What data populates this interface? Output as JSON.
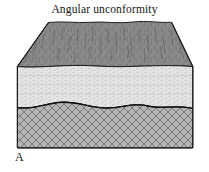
{
  "figure": {
    "title": "Angular unconformity",
    "panel_label": "A",
    "type": "geologic-block-diagram",
    "subject": "angular unconformity"
  },
  "diagram": {
    "view": "three-dimensional block diagram with top surface in oblique perspective",
    "outline_color": "#1a1a1a",
    "background_color": "#ffffff",
    "units": [
      {
        "name": "top-surface",
        "description": "eroded land surface shown in oblique perspective",
        "fill_color": "#8b8b8b",
        "texture": "fine vertical streaks",
        "shape": "trapezoid"
      },
      {
        "name": "upper-sedimentary-layer",
        "description": "flat-lying younger sedimentary beds above the unconformity",
        "fill_color": "#e3e3e3",
        "texture": "fine horizontal stipple dashes",
        "shape": "rectangular front face"
      },
      {
        "name": "lower-tilted-layer",
        "description": "older tilted and eroded rock beneath the unconformity",
        "fill_color": "#b4b4b4",
        "texture": "diagonal cross-hatch lattice",
        "shape": "rectangular front face with wavy top"
      }
    ],
    "contacts": [
      {
        "name": "erosional-unconformity-surface",
        "description": "wavy erosional boundary separating tilted lower rocks from flat upper beds",
        "style": "undulating solid line"
      },
      {
        "name": "ground-surface-contact",
        "description": "boundary between top perspective surface and upper sedimentary layer",
        "style": "irregular solid line"
      }
    ],
    "geometry": {
      "front_face_left_x": 17,
      "front_face_right_x": 193,
      "front_face_top_y": 67,
      "front_face_bottom_y": 148,
      "top_surface_back_left_x": 48,
      "top_surface_back_right_x": 172,
      "top_surface_back_y": 22,
      "unconformity_mean_y": 106
    }
  }
}
